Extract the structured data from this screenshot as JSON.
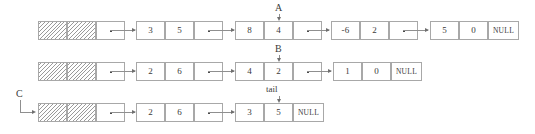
{
  "diagram": {
    "colors": {
      "stroke": "#a8a8a8",
      "connector": "#8f8f8f",
      "text": "#3a3a3a",
      "hatch": "#9a9a9a",
      "background": "#ffffff"
    },
    "labels": [
      {
        "id": "A",
        "text": "A",
        "target": "row1-node3-cell2"
      },
      {
        "id": "B",
        "text": "B",
        "target": "row2-node3-cell1"
      },
      {
        "id": "tail",
        "text": "tail",
        "target": "row3-node3-cell1"
      },
      {
        "id": "C",
        "text": "C",
        "target": "row3-node1-cell1"
      }
    ],
    "rows": [
      {
        "id": "row1",
        "nodes": [
          {
            "id": "row1-node1",
            "cells": [
              {
                "kind": "hatch",
                "text": ""
              },
              {
                "kind": "hatch",
                "text": ""
              },
              {
                "kind": "pointer",
                "text": ""
              }
            ]
          },
          {
            "id": "row1-node2",
            "cells": [
              {
                "kind": "value",
                "text": "3"
              },
              {
                "kind": "value",
                "text": "5"
              },
              {
                "kind": "pointer",
                "text": ""
              }
            ]
          },
          {
            "id": "row1-node3",
            "cells": [
              {
                "kind": "value",
                "text": "8"
              },
              {
                "kind": "value",
                "text": "4"
              },
              {
                "kind": "pointer",
                "text": ""
              }
            ]
          },
          {
            "id": "row1-node4",
            "cells": [
              {
                "kind": "value",
                "text": "-6"
              },
              {
                "kind": "value",
                "text": "2"
              },
              {
                "kind": "pointer",
                "text": ""
              }
            ]
          },
          {
            "id": "row1-node5",
            "cells": [
              {
                "kind": "value",
                "text": "5"
              },
              {
                "kind": "value",
                "text": "0"
              },
              {
                "kind": "null",
                "text": "NULL"
              }
            ]
          }
        ]
      },
      {
        "id": "row2",
        "nodes": [
          {
            "id": "row2-node1",
            "cells": [
              {
                "kind": "hatch",
                "text": ""
              },
              {
                "kind": "hatch",
                "text": ""
              },
              {
                "kind": "pointer",
                "text": ""
              }
            ]
          },
          {
            "id": "row2-node2",
            "cells": [
              {
                "kind": "value",
                "text": "2"
              },
              {
                "kind": "value",
                "text": "6"
              },
              {
                "kind": "pointer",
                "text": ""
              }
            ]
          },
          {
            "id": "row2-node3",
            "cells": [
              {
                "kind": "value",
                "text": "4"
              },
              {
                "kind": "value",
                "text": "2"
              },
              {
                "kind": "pointer",
                "text": ""
              }
            ]
          },
          {
            "id": "row2-node4",
            "cells": [
              {
                "kind": "value",
                "text": "1"
              },
              {
                "kind": "value",
                "text": "0"
              },
              {
                "kind": "null",
                "text": "NULL"
              }
            ]
          }
        ]
      },
      {
        "id": "row3",
        "nodes": [
          {
            "id": "row3-node1",
            "cells": [
              {
                "kind": "hatch",
                "text": ""
              },
              {
                "kind": "hatch",
                "text": ""
              },
              {
                "kind": "pointer",
                "text": ""
              }
            ]
          },
          {
            "id": "row3-node2",
            "cells": [
              {
                "kind": "value",
                "text": "2"
              },
              {
                "kind": "value",
                "text": "6"
              },
              {
                "kind": "pointer",
                "text": ""
              }
            ]
          },
          {
            "id": "row3-node3",
            "cells": [
              {
                "kind": "value",
                "text": "3"
              },
              {
                "kind": "value",
                "text": "5"
              },
              {
                "kind": "null",
                "text": "NULL"
              }
            ]
          }
        ]
      }
    ]
  }
}
